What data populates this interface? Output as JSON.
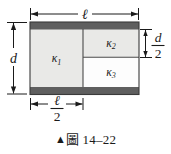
{
  "figure": {
    "caption_marker": "▲",
    "caption_text": "圖 14–22",
    "labels": {
      "kappa1": "κ₁",
      "kappa2": "κ₂",
      "kappa3": "κ₃"
    },
    "dimensions": {
      "top": "ℓ",
      "left": "d",
      "right_num": "d",
      "right_den": "2",
      "bottom_num": "ℓ",
      "bottom_den": "2"
    },
    "colors": {
      "band": "#5f5f5f",
      "region1_fill": "#e9e9e7",
      "region2_fill": "#e9e9e7",
      "region3_fill": "#fdfdfd",
      "outline": "#3a3a3a",
      "ink": "#1a1a1a",
      "background": "#ffffff"
    }
  }
}
